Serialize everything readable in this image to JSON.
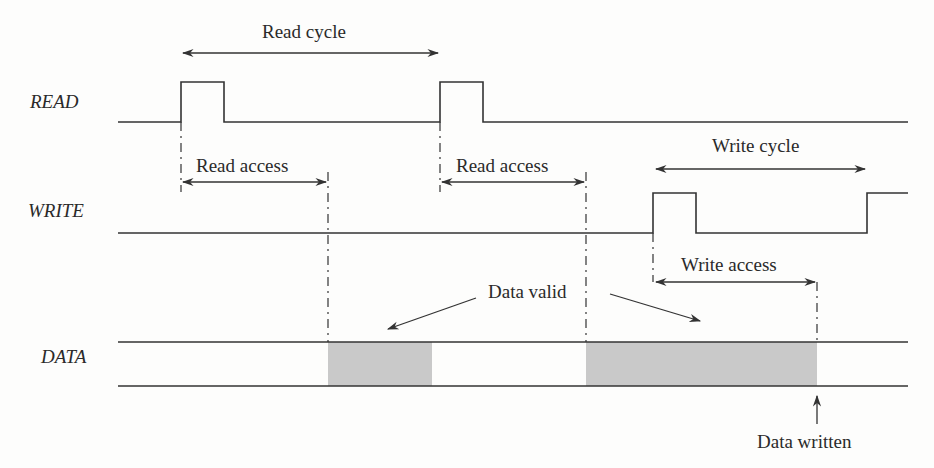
{
  "signals": {
    "read": "READ",
    "write": "WRITE",
    "data": "DATA"
  },
  "annotations": {
    "read_cycle": "Read cycle",
    "read_access_1": "Read access",
    "read_access_2": "Read access",
    "write_cycle": "Write cycle",
    "write_access": "Write access",
    "data_valid": "Data valid",
    "data_written": "Data written"
  },
  "colors": {
    "line": "#333333",
    "shade": "#c9c9c9",
    "background": "#fdfdfc"
  }
}
